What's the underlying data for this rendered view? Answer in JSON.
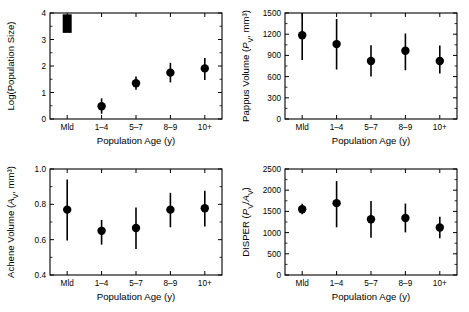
{
  "figure": {
    "categories": [
      "Mld",
      "1–4",
      "5–7",
      "8–9",
      "10+"
    ],
    "xlabel": "Population Age (y)"
  },
  "chart_data": [
    {
      "panel": "top-left",
      "type": "scatter",
      "title": "",
      "xlabel": "Population Age (y)",
      "ylabel": "Log(Population Size)",
      "ylabel_parts": {
        "pre": "Log(Population Size)",
        "italic": "",
        "sub": "",
        "post": ""
      },
      "categories": [
        "Mld",
        "1–4",
        "5–7",
        "8–9",
        "10+"
      ],
      "values": [
        3.6,
        0.48,
        1.35,
        1.75,
        1.91
      ],
      "err_low": [
        3.25,
        0.2,
        1.1,
        1.38,
        1.47
      ],
      "err_high": [
        3.95,
        0.78,
        1.6,
        2.12,
        2.3
      ],
      "marker_style": [
        "bar",
        "circle",
        "circle",
        "circle",
        "circle"
      ],
      "ylim": [
        0,
        4
      ],
      "yticks": [
        0,
        1,
        2,
        3,
        4
      ],
      "yticklabels": [
        "0",
        "1",
        "2",
        "3",
        "4"
      ],
      "grid": false,
      "legend": "none"
    },
    {
      "panel": "top-right",
      "type": "scatter",
      "title": "",
      "xlabel": "Population Age (y)",
      "ylabel": "Pappus Volume (PV, mm3)",
      "ylabel_parts": {
        "pre": "Pappus Volume (",
        "italic": "P",
        "sub": "V",
        "post": ", mm³)"
      },
      "categories": [
        "Mld",
        "1–4",
        "5–7",
        "8–9",
        "10+"
      ],
      "values": [
        1185,
        1060,
        820,
        965,
        820
      ],
      "err_low": [
        835,
        700,
        600,
        690,
        645
      ],
      "err_high": [
        1520,
        1415,
        1045,
        1210,
        1040
      ],
      "marker_style": [
        "circle",
        "circle",
        "circle",
        "circle",
        "circle"
      ],
      "ylim": [
        0,
        1500
      ],
      "yticks": [
        0,
        300,
        600,
        900,
        1200,
        1500
      ],
      "yticklabels": [
        "0",
        "300",
        "600",
        "900",
        "1200",
        "1500"
      ],
      "grid": false,
      "legend": "none"
    },
    {
      "panel": "bottom-left",
      "type": "scatter",
      "title": "",
      "xlabel": "Population Age (y)",
      "ylabel": "Achene Volume (AV, mm3)",
      "ylabel_parts": {
        "pre": "Achene Volume (",
        "italic": "A",
        "sub": "V",
        "post": ", mm³)"
      },
      "categories": [
        "Mld",
        "1–4",
        "5–7",
        "8–9",
        "10+"
      ],
      "values": [
        0.77,
        0.65,
        0.666,
        0.77,
        0.778
      ],
      "err_low": [
        0.595,
        0.572,
        0.547,
        0.67,
        0.675
      ],
      "err_high": [
        0.94,
        0.712,
        0.782,
        0.865,
        0.877
      ],
      "marker_style": [
        "circle",
        "circle",
        "circle",
        "circle",
        "circle"
      ],
      "ylim": [
        0.4,
        1.0
      ],
      "yticks": [
        0.4,
        0.6,
        0.8,
        1.0
      ],
      "yticklabels": [
        "0.4",
        "0.6",
        "0.8",
        "1.0"
      ],
      "grid": false,
      "legend": "none"
    },
    {
      "panel": "bottom-right",
      "type": "scatter",
      "title": "",
      "xlabel": "Population Age (y)",
      "ylabel": "DISPER (PV/AV)",
      "ylabel_parts": {
        "pre": "DISPER (",
        "italic": "P",
        "sub": "V",
        "post": ")"
      },
      "categories": [
        "Mld",
        "1–4",
        "5–7",
        "8–9",
        "10+"
      ],
      "values": [
        1550,
        1695,
        1315,
        1345,
        1120
      ],
      "err_low": [
        1430,
        1125,
        880,
        1005,
        865
      ],
      "err_high": [
        1680,
        2215,
        1745,
        1685,
        1375
      ],
      "marker_style": [
        "circle",
        "circle",
        "circle",
        "circle",
        "circle"
      ],
      "ylim": [
        0,
        2500
      ],
      "yticks": [
        0,
        500,
        1000,
        1500,
        2000,
        2500
      ],
      "yticklabels": [
        "0",
        "500",
        "1000",
        "1500",
        "2000",
        "2500"
      ],
      "grid": false,
      "legend": "none"
    }
  ]
}
